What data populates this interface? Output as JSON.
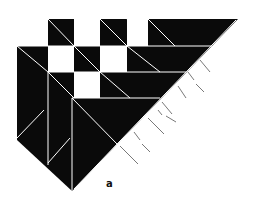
{
  "figure": {
    "label": "a",
    "colors": {
      "fill": "#0a0a0a",
      "background": "#ffffff",
      "line": "#ffffff",
      "tick": "#555555"
    }
  }
}
